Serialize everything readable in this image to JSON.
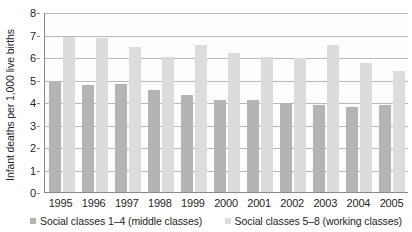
{
  "chart_data": {
    "type": "bar",
    "title": "",
    "xlabel": "",
    "ylabel": "Infant deaths per 1,000 live births",
    "ylim": [
      0,
      8
    ],
    "ytick_labels": [
      "0",
      "1",
      "2",
      "3",
      "4",
      "5",
      "6",
      "7",
      "8"
    ],
    "yticks": [
      0,
      1,
      2,
      3,
      4,
      5,
      6,
      7,
      8
    ],
    "grid": true,
    "legend_position": "bottom",
    "categories": [
      "1995",
      "1996",
      "1997",
      "1998",
      "1999",
      "2000",
      "2001",
      "2002",
      "2003",
      "2004",
      "2005"
    ],
    "series": [
      {
        "name": "Social classes 1–4  (middle classes)",
        "color": "#b4b4b4",
        "values": [
          4.9,
          4.75,
          4.8,
          4.55,
          4.3,
          4.1,
          4.1,
          3.95,
          3.85,
          3.8,
          3.85
        ]
      },
      {
        "name": "Social classes 5–8 (working classes)",
        "color": "#dcdcdc",
        "values": [
          6.9,
          6.85,
          6.45,
          6.0,
          6.55,
          6.2,
          6.0,
          5.95,
          6.55,
          5.75,
          5.4
        ]
      }
    ]
  },
  "legend": {
    "items": [
      {
        "label": "Social classes 1–4  (middle classes)",
        "color": "#b4b4b4"
      },
      {
        "label": "Social classes 5–8 (working classes)",
        "color": "#dcdcdc"
      }
    ]
  }
}
